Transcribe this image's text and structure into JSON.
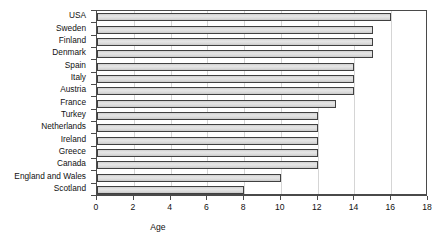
{
  "chart_data": {
    "type": "bar",
    "orientation": "horizontal",
    "title": "",
    "xlabel": "Age",
    "ylabel": "",
    "xlim": [
      0,
      18
    ],
    "xticks": [
      0,
      2,
      4,
      6,
      8,
      10,
      12,
      14,
      16,
      18
    ],
    "grid": true,
    "grid_axis": "x",
    "legend": false,
    "categories": [
      "USA",
      "Sweden",
      "Finland",
      "Denmark",
      "Spain",
      "Italy",
      "Austria",
      "France",
      "Turkey",
      "Netherlands",
      "Ireland",
      "Greece",
      "Canada",
      "England and Wales",
      "Scotland"
    ],
    "values": [
      16,
      15,
      15,
      15,
      14,
      14,
      14,
      13,
      12,
      12,
      12,
      12,
      12,
      10,
      8
    ],
    "bar_color": "#d7d7d7",
    "bar_border_color": "#404040",
    "axis_color": "#4a4a4a",
    "grid_color": "#d5d5d5"
  }
}
